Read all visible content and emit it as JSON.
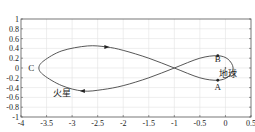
{
  "chart_data": {
    "type": "line",
    "title": "",
    "xlabel": "",
    "ylabel": "",
    "xlim": [
      -4,
      0.5
    ],
    "ylim": [
      -1,
      1
    ],
    "grid": true,
    "xticks": [
      "-4",
      "-3.5",
      "-3",
      "-2.5",
      "-2",
      "-1.5",
      "-1",
      "-0.5",
      "0",
      "0.5"
    ],
    "yticks": [
      "1",
      "0.8",
      "0.6",
      "0.4",
      "0.2",
      "0",
      "-0.2",
      "-0.4",
      "-0.6",
      "-0.8",
      "-1"
    ],
    "series": [
      {
        "name": "火星相对地球轨迹",
        "x": [
          -0.15,
          0.05,
          0.15,
          0.05,
          -0.15,
          -0.5,
          -1.0,
          -1.5,
          -2.0,
          -2.33,
          -2.7,
          -3.2,
          -3.55,
          -3.65,
          -3.55,
          -3.2,
          -2.79,
          -2.4,
          -2.0,
          -1.5,
          -1.0,
          -0.5,
          -0.15
        ],
        "y": [
          0.25,
          0.18,
          0.0,
          -0.18,
          -0.25,
          -0.2,
          0.0,
          0.2,
          0.36,
          0.43,
          0.45,
          0.35,
          0.15,
          0.0,
          -0.15,
          -0.36,
          -0.47,
          -0.44,
          -0.36,
          -0.2,
          0.0,
          0.2,
          0.25
        ]
      }
    ],
    "annotations": [
      {
        "text": "A",
        "x": -0.15,
        "y": -0.38
      },
      {
        "text": "B",
        "x": -0.15,
        "y": 0.18
      },
      {
        "text": "C",
        "x": -3.8,
        "y": 0.0
      },
      {
        "text": "地球",
        "x": 0.05,
        "y": -0.12
      },
      {
        "text": "火星",
        "x": -3.2,
        "y": -0.52
      }
    ],
    "markers": [
      {
        "name": "point-B",
        "x": -0.15,
        "y": 0.25
      },
      {
        "name": "point-A",
        "x": -0.15,
        "y": -0.25
      },
      {
        "name": "earth",
        "x": 0.0,
        "y": 0.0
      },
      {
        "name": "arrow-top",
        "x": -2.33,
        "y": 0.43,
        "direction": "right"
      },
      {
        "name": "arrow-bottom",
        "x": -2.79,
        "y": -0.47,
        "direction": "left"
      }
    ]
  }
}
